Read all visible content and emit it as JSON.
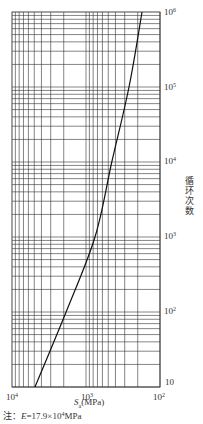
{
  "chart_data": {
    "type": "line",
    "title": "",
    "xlabel": "Sa(MPa)",
    "ylabel": "循环次数",
    "xscale": "log",
    "yscale": "log",
    "x_reversed": true,
    "xlim": [
      10000,
      100
    ],
    "ylim": [
      10,
      1000000
    ],
    "grid": true,
    "x_tick_labels": [
      "10^4",
      "10^3",
      "10^2"
    ],
    "y_tick_labels": [
      "10^6",
      "10^5",
      "10^4",
      "10^3",
      "10^2",
      "10"
    ],
    "series": [
      {
        "name": "design fatigue curve",
        "x": [
          4890,
          1860,
          755,
          448,
          262,
          175
        ],
        "y": [
          10,
          100,
          1000,
          10000,
          100000,
          1000000
        ]
      }
    ],
    "note": "注：E=17.9×10^4 MPa"
  },
  "labels": {
    "x_ticks": [
      {
        "base": "10",
        "exp": "4"
      },
      {
        "base": "10",
        "exp": "3"
      },
      {
        "base": "10",
        "exp": "2"
      }
    ],
    "y_ticks": [
      {
        "base": "10",
        "exp": "6"
      },
      {
        "base": "10",
        "exp": "5"
      },
      {
        "base": "10",
        "exp": "4"
      },
      {
        "base": "10",
        "exp": "3"
      },
      {
        "base": "10",
        "exp": "2"
      },
      {
        "base": "10",
        "exp": ""
      }
    ],
    "xlabel_symbol": "S",
    "xlabel_sub": "a",
    "xlabel_unit": "(MPa)",
    "ylabel": "循环次数",
    "note_prefix": "注：",
    "note_var": "E",
    "note_eq": "=17.9×10",
    "note_exp": "4",
    "note_unit": "MPa"
  },
  "colors": {
    "grid": "#333333",
    "curve": "#111111",
    "text": "#333333"
  }
}
